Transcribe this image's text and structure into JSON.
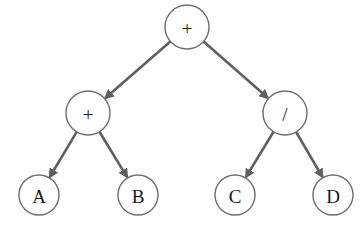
{
  "diagram": {
    "type": "expression-tree",
    "colors": {
      "edge": "#5f5f5f",
      "node_stroke": "#6e6e6e",
      "node_fill": "#ffffff",
      "text": "#1a1a1a"
    },
    "nodes": [
      {
        "id": "root",
        "label": "+",
        "cx": 187,
        "cy": 27,
        "r": 22
      },
      {
        "id": "left",
        "label": "+",
        "cx": 88,
        "cy": 113,
        "r": 22
      },
      {
        "id": "right",
        "label": "/",
        "cx": 285,
        "cy": 113,
        "r": 22
      },
      {
        "id": "A",
        "label": "A",
        "cx": 39,
        "cy": 195,
        "r": 20
      },
      {
        "id": "B",
        "label": "B",
        "cx": 138,
        "cy": 195,
        "r": 20
      },
      {
        "id": "C",
        "label": "C",
        "cx": 235,
        "cy": 195,
        "r": 20
      },
      {
        "id": "D",
        "label": "D",
        "cx": 333,
        "cy": 195,
        "r": 20
      }
    ],
    "edges": [
      {
        "from": "root",
        "to": "left"
      },
      {
        "from": "root",
        "to": "right"
      },
      {
        "from": "left",
        "to": "A"
      },
      {
        "from": "left",
        "to": "B"
      },
      {
        "from": "right",
        "to": "C"
      },
      {
        "from": "right",
        "to": "D"
      }
    ]
  }
}
